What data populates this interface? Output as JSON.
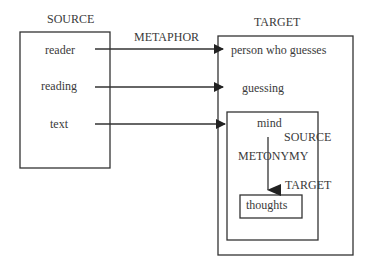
{
  "source_domain": {
    "label": "SOURCE",
    "items": [
      "reader",
      "reading",
      "text"
    ]
  },
  "mapping": {
    "label": "METAPHOR"
  },
  "target_domain": {
    "label": "TARGET",
    "items": [
      "person who guesses",
      "guessing"
    ]
  },
  "inner_frame": {
    "source_label": "SOURCE",
    "source_item": "mind",
    "mapping_label": "METONYMY",
    "target_label": "TARGET",
    "target_item": "thoughts"
  },
  "colors": {
    "line": "#333333",
    "text": "#3a3a3a",
    "background": "#ffffff"
  }
}
